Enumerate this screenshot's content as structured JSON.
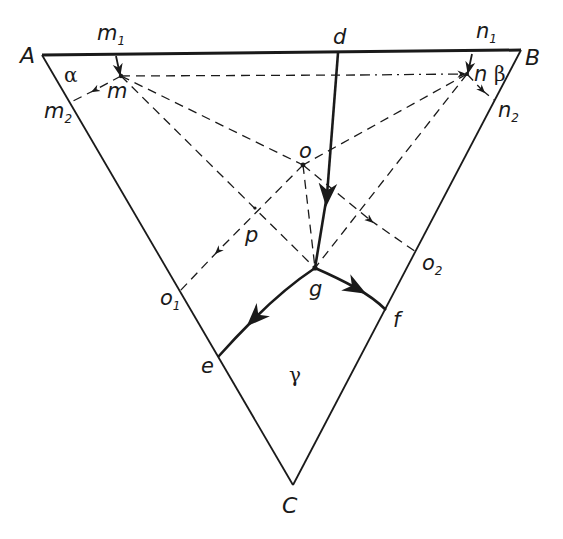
{
  "diagram": {
    "type": "ternary phase diagram",
    "vertices": {
      "A": {
        "label": "A",
        "x": 42,
        "y": 55
      },
      "B": {
        "label": "B",
        "x": 521,
        "y": 50
      },
      "C": {
        "label": "C",
        "x": 293,
        "y": 485
      }
    },
    "points": {
      "m": {
        "label": "m",
        "x": 121,
        "y": 76
      },
      "m1": {
        "label": "m",
        "sub": "1",
        "x": 116,
        "y": 56
      },
      "m2": {
        "label": "m",
        "sub": "2",
        "x": 73,
        "y": 102
      },
      "n": {
        "label": "n",
        "x": 467,
        "y": 74
      },
      "n1": {
        "label": "n",
        "sub": "1",
        "x": 476,
        "y": 52
      },
      "n2": {
        "label": "n",
        "sub": "2",
        "x": 494,
        "y": 100
      },
      "d": {
        "label": "d",
        "x": 338,
        "y": 53
      },
      "o": {
        "label": "o",
        "x": 303,
        "y": 165
      },
      "p": {
        "label": "p",
        "x": 255,
        "y": 208
      },
      "g": {
        "label": "g",
        "x": 315,
        "y": 268
      },
      "o1": {
        "label": "o",
        "sub": "1",
        "x": 180,
        "y": 291
      },
      "o2": {
        "label": "o",
        "sub": "2",
        "x": 416,
        "y": 252
      },
      "e": {
        "label": "e",
        "x": 218,
        "y": 357
      },
      "f": {
        "label": "f",
        "x": 386,
        "y": 310
      }
    },
    "regions": {
      "alpha": {
        "label": "α",
        "x": 72,
        "y": 83
      },
      "beta": {
        "label": "β",
        "x": 498,
        "y": 78
      },
      "gamma": {
        "label": "γ",
        "x": 296,
        "y": 372
      }
    },
    "labels": {
      "A": "A",
      "B": "B",
      "C": "C",
      "m": "m",
      "m1": "m",
      "m1_sub": "1",
      "m2": "m",
      "m2_sub": "2",
      "n": "n",
      "n1": "n",
      "n1_sub": "1",
      "n2": "n",
      "n2_sub": "2",
      "d": "d",
      "o": "o",
      "p": "p",
      "g": "g",
      "o1": "o",
      "o1_sub": "1",
      "o2": "o",
      "o2_sub": "2",
      "e": "e",
      "f": "f",
      "alpha": "α",
      "beta": "β",
      "gamma": "γ"
    },
    "colors": {
      "ink": "#1a1a1a",
      "background": "#ffffff"
    },
    "solid_curves": [
      {
        "from": "d",
        "to": "g",
        "arrow": "toward g"
      },
      {
        "from": "g",
        "to": "e",
        "arrow": "toward e"
      },
      {
        "from": "g",
        "to": "f",
        "arrow": "toward f"
      },
      {
        "from": "m1",
        "to": "m",
        "arrow": "toward m"
      },
      {
        "from": "n1",
        "to": "n",
        "arrow": "toward n"
      }
    ],
    "dashed_lines": [
      {
        "from": "m",
        "to": "n",
        "style": "dash / dash-dot",
        "arrow": "toward n"
      },
      {
        "from": "m",
        "to": "m2",
        "arrow": "toward m2"
      },
      {
        "from": "n",
        "to": "n2",
        "arrow": "toward n2"
      },
      {
        "from": "m",
        "to": "o"
      },
      {
        "from": "n",
        "to": "o"
      },
      {
        "from": "m",
        "to": "g"
      },
      {
        "from": "n",
        "to": "g"
      },
      {
        "from": "o",
        "to": "g"
      },
      {
        "from": "o",
        "to": "o1",
        "arrow": "toward o1"
      },
      {
        "from": "o",
        "to": "o2",
        "arrow": "toward o2"
      }
    ]
  }
}
